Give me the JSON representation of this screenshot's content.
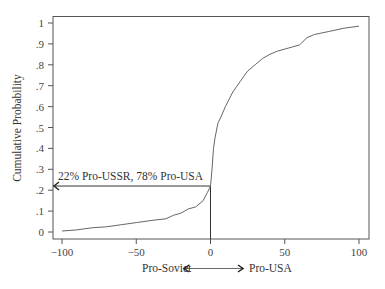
{
  "chart_data": {
    "type": "line",
    "title": "",
    "xlabel": "Pro-Soviet ⟷ Pro-USA",
    "xlabel_left": "Pro-Soviet",
    "xlabel_right": "Pro-USA",
    "ylabel": "Cumulative Probability",
    "xlim": [
      -100,
      100
    ],
    "ylim": [
      0,
      1
    ],
    "grid": false,
    "legend": null,
    "x_ticks": [
      -100,
      -50,
      0,
      50,
      100
    ],
    "x_tick_labels": [
      "−100",
      "−50",
      "0",
      "50",
      "100"
    ],
    "y_ticks": [
      0,
      0.1,
      0.2,
      0.3,
      0.4,
      0.5,
      0.6,
      0.7,
      0.8,
      0.9,
      1
    ],
    "y_tick_labels": [
      "0",
      ".1",
      ".2",
      ".3",
      ".4",
      ".5",
      ".6",
      ".7",
      ".8",
      ".9",
      "1"
    ],
    "series": [
      {
        "name": "Cumulative distribution",
        "x": [
          -100,
          -90,
          -80,
          -70,
          -60,
          -50,
          -40,
          -30,
          -25,
          -20,
          -15,
          -10,
          -5,
          -2,
          0,
          1,
          2,
          3,
          5,
          7,
          10,
          15,
          20,
          25,
          30,
          35,
          40,
          45,
          55,
          60,
          65,
          70,
          80,
          90,
          100
        ],
        "y": [
          0.005,
          0.01,
          0.02,
          0.025,
          0.035,
          0.045,
          0.055,
          0.063,
          0.08,
          0.09,
          0.11,
          0.12,
          0.15,
          0.19,
          0.22,
          0.3,
          0.4,
          0.45,
          0.52,
          0.55,
          0.6,
          0.67,
          0.72,
          0.77,
          0.8,
          0.83,
          0.85,
          0.865,
          0.885,
          0.895,
          0.93,
          0.945,
          0.96,
          0.975,
          0.985
        ]
      }
    ],
    "annotations": [
      {
        "text": "22% Pro-USSR, 78% Pro-USA",
        "x": 0,
        "y": 0.22,
        "type": "crosshair-arrow-to-y-axis"
      }
    ]
  }
}
